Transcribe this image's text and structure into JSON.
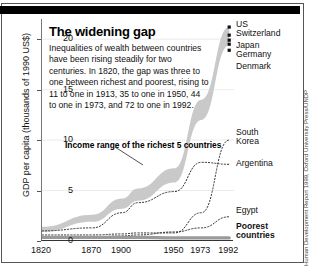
{
  "figure": {
    "title": "The widening gap",
    "body": "Inequalities of wealth between countries have been rising steadily for two centuries. In 1820, the gap was three to one between richest and poorest, rising to 11 to one in 1913, 35 to one in 1950, 44 to one in 1973, and 72 to one in 1992.",
    "annotation": "Income range of the richest 5 countries",
    "credit": "Human Development Report 1999, Oxford University Press/UNDP"
  },
  "chart_data": {
    "type": "line",
    "title": "The widening gap",
    "xlabel": "",
    "ylabel": "GDP per capita (thousands of 1990 US$)",
    "xlim": [
      1820,
      1992
    ],
    "ylim": [
      0,
      22
    ],
    "xticks": [
      "1820",
      "1870",
      "1900",
      "1950",
      "1973",
      "1992"
    ],
    "xtick_values": [
      1820,
      1870,
      1900,
      1950,
      1973,
      1992
    ],
    "yticks": [
      "0",
      "5",
      "10",
      "15",
      "20"
    ],
    "ytick_values": [
      0,
      5,
      10,
      15,
      20
    ],
    "grid": false,
    "legend_position": "right-inline",
    "band": {
      "name": "Income range of the richest 5 countries",
      "color": "#c9c9c9",
      "x": [
        1820,
        1870,
        1900,
        1913,
        1950,
        1973,
        1992
      ],
      "upper": [
        1.4,
        2.6,
        4.2,
        5.2,
        7.2,
        14.0,
        21.2
      ],
      "lower": [
        0.9,
        1.9,
        3.2,
        4.0,
        5.8,
        12.0,
        19.4
      ],
      "endpoint_labels": [
        "US",
        "Switzerland",
        "Japan",
        "Germany",
        "Denmark"
      ],
      "endpoint_values": [
        21.2,
        20.4,
        19.9,
        19.5,
        18.9
      ]
    },
    "series": [
      {
        "name": "South Korea",
        "style": "dotted",
        "color": "#333333",
        "x": [
          1820,
          1870,
          1900,
          1913,
          1950,
          1973,
          1992
        ],
        "values": [
          0.6,
          0.6,
          0.7,
          0.8,
          0.8,
          2.8,
          10.0
        ]
      },
      {
        "name": "Argentina",
        "style": "dash-dot",
        "color": "#333333",
        "x": [
          1820,
          1870,
          1900,
          1913,
          1950,
          1973,
          1992
        ],
        "values": [
          1.0,
          1.3,
          2.8,
          3.8,
          4.9,
          7.8,
          7.6
        ]
      },
      {
        "name": "Egypt",
        "style": "dash-dot",
        "color": "#333333",
        "x": [
          1820,
          1870,
          1900,
          1913,
          1950,
          1973,
          1992
        ],
        "values": [
          0.3,
          0.4,
          0.5,
          0.6,
          0.9,
          1.3,
          2.4
        ]
      },
      {
        "name": "Poorest countries",
        "style": "solid-thick",
        "color": "#9a9a9a",
        "x": [
          1820,
          1870,
          1900,
          1913,
          1950,
          1973,
          1992
        ],
        "values": [
          0.35,
          0.35,
          0.35,
          0.35,
          0.3,
          0.3,
          0.3
        ]
      }
    ],
    "right_labels": [
      {
        "text": "US",
        "bold": false
      },
      {
        "text": "Switzerland",
        "bold": false
      },
      {
        "text": "Japan",
        "bold": false
      },
      {
        "text": "Germany",
        "bold": false
      },
      {
        "text": "Denmark",
        "bold": false
      },
      {
        "text": "South",
        "bold": false
      },
      {
        "text": "Korea",
        "bold": false
      },
      {
        "text": "Argentina",
        "bold": false
      },
      {
        "text": "Egypt",
        "bold": false
      },
      {
        "text": "Poorest",
        "bold": true
      },
      {
        "text": "countries",
        "bold": true
      }
    ]
  }
}
